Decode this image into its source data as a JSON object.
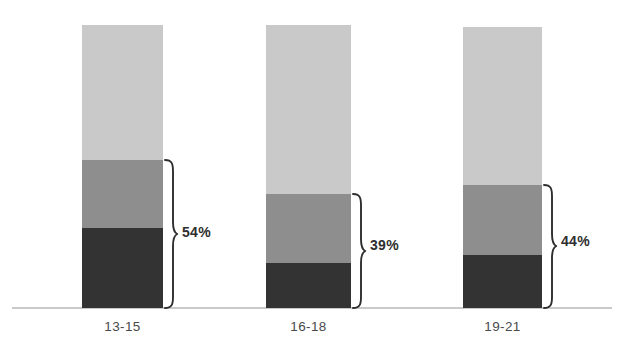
{
  "chart_data": {
    "type": "bar",
    "title": "",
    "subtitle": "",
    "xlabel": "",
    "ylabel": "",
    "stacked": true,
    "normalized_percent": true,
    "grid": false,
    "legend": "none",
    "ylim": [
      0,
      100
    ],
    "categories": [
      "13-15",
      "16-18",
      "19-21"
    ],
    "series": [
      {
        "name": "dark-segment",
        "color": "#333333",
        "values": [
          28,
          16,
          19
        ]
      },
      {
        "name": "medium-segment",
        "color": "#8e8e8e",
        "values": [
          24,
          24,
          25
        ]
      },
      {
        "name": "light-segment",
        "color": "#c9c9c9",
        "values": [
          48,
          60,
          56
        ]
      }
    ],
    "annotations": [
      {
        "category": "13-15",
        "label": "54%",
        "covers": [
          "dark-segment",
          "medium-segment"
        ]
      },
      {
        "category": "16-18",
        "label": "39%",
        "covers": [
          "dark-segment",
          "medium-segment"
        ]
      },
      {
        "category": "19-21",
        "label": "44%",
        "covers": [
          "dark-segment",
          "medium-segment"
        ]
      }
    ]
  },
  "axis": {
    "baseline_color": "#c9c9c9",
    "tick_labels": [
      "13-15",
      "16-18",
      "19-21"
    ]
  },
  "bars": [
    {
      "category": "13-15",
      "left_px": 82,
      "width_px": 81,
      "top_px": 25,
      "base_px": 308,
      "light_height_px": 135,
      "medium_height_px": 68,
      "dark_height_px": 80,
      "brace_label": "54%"
    },
    {
      "category": "16-18",
      "left_px": 266,
      "width_px": 85,
      "top_px": 25,
      "base_px": 308,
      "light_height_px": 169,
      "medium_height_px": 69,
      "dark_height_px": 45,
      "brace_label": "39%"
    },
    {
      "category": "19-21",
      "left_px": 463,
      "width_px": 79,
      "top_px": 27,
      "base_px": 308,
      "light_height_px": 158,
      "medium_height_px": 70,
      "dark_height_px": 53,
      "brace_label": "44%"
    }
  ],
  "colors": {
    "light": "#c9c9c9",
    "medium": "#8e8e8e",
    "dark": "#333333",
    "axis": "#c9c9c9",
    "text": "#4a4a4a",
    "annotation_text": "#2e2e2e",
    "background": "#ffffff"
  }
}
